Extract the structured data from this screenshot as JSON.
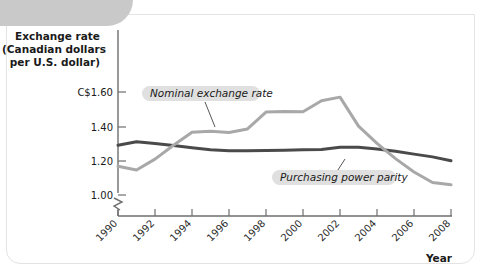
{
  "figure": {
    "corner_tab": "decorative-tab",
    "year_axis_label": "Year"
  },
  "chart_data": {
    "type": "line",
    "title": "",
    "ylabel": "Exchange rate\n(Canadian dollars\nper U.S. dollar)",
    "ylabel_lines": [
      "Exchange rate",
      "(Canadian dollars",
      "per U.S. dollar)"
    ],
    "xlabel": "Year",
    "ylim": [
      0.94,
      1.66
    ],
    "yticks": [
      1.0,
      1.2,
      1.4,
      1.6
    ],
    "ytick_labels": [
      "1.00",
      "1.20",
      "1.40",
      "C$1.60"
    ],
    "axis_break": true,
    "xlim": [
      1990,
      2008
    ],
    "xticks": [
      1990,
      1992,
      1994,
      1996,
      1998,
      2000,
      2002,
      2004,
      2006,
      2008
    ],
    "xtick_labels": [
      "1990",
      "1992",
      "1994",
      "1996",
      "1998",
      "2000",
      "2002",
      "2004",
      "2006",
      "2008"
    ],
    "grid": false,
    "legend_position": "inline-annotations",
    "x": [
      1990,
      1991,
      1992,
      1993,
      1994,
      1995,
      1996,
      1997,
      1998,
      1999,
      2000,
      2001,
      2002,
      2003,
      2004,
      2005,
      2006,
      2007,
      2008
    ],
    "series": [
      {
        "name": "Nominal exchange rate",
        "color": "#a8a8a8",
        "values": [
          1.167,
          1.146,
          1.209,
          1.29,
          1.366,
          1.372,
          1.364,
          1.385,
          1.483,
          1.486,
          1.485,
          1.549,
          1.57,
          1.401,
          1.301,
          1.212,
          1.134,
          1.073,
          1.06
        ]
      },
      {
        "name": "Purchasing power parity",
        "color": "#4a4a4a",
        "values": [
          1.29,
          1.31,
          1.3,
          1.288,
          1.275,
          1.263,
          1.258,
          1.258,
          1.259,
          1.261,
          1.263,
          1.265,
          1.278,
          1.278,
          1.268,
          1.255,
          1.238,
          1.222,
          1.2
        ]
      }
    ],
    "annotations": [
      {
        "text": "Nominal exchange rate",
        "series": "Nominal exchange rate"
      },
      {
        "text": "Purchasing power parity",
        "series": "Purchasing power parity"
      }
    ]
  }
}
